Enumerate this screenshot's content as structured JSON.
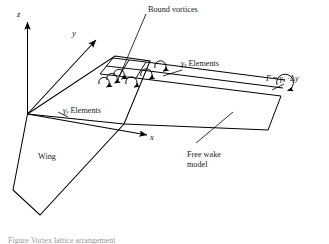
{
  "figure": {
    "type": "technical-diagram",
    "background_color": "#ffffff",
    "line_color": "#000000",
    "text_color": "#1a1a1a"
  },
  "axes": {
    "z_label": "z",
    "y_label": "y",
    "x_label": "x",
    "origin_note": "common origin at wing root leading edge"
  },
  "labels": {
    "bound_vortices": "Bound vortices",
    "gamma_x_elements_symbol": "γ",
    "gamma_x_elements_sub": "x",
    "gamma_x_elements_text": "Elements",
    "gamma_y_elements_symbol": "γ",
    "gamma_y_elements_sub": "y",
    "gamma_y_elements_text": "Elements",
    "wing": "Wing",
    "free_wake_line1": "Free wake",
    "free_wake_line2": "model"
  },
  "equation": {
    "gamma_capital": "Γ",
    "equals": "=",
    "gamma_small": "γ",
    "gamma_sub": "x",
    "dot": "·",
    "delta": "Δ",
    "delta_var": "y",
    "full_text": "Γ = γx · Δy"
  },
  "caption": {
    "partial_text": "Figure  Vortex lattice arrangement"
  }
}
